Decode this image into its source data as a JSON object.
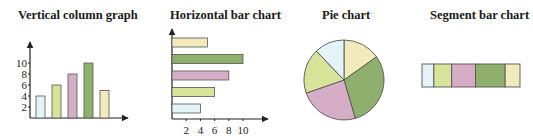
{
  "colors": {
    "blue": "#e4f3f8",
    "lime": "#d8e39a",
    "pink": "#d5adc4",
    "green": "#8fb06c",
    "cream": "#f1ebbc",
    "stroke": "#555555",
    "axis": "#222222"
  },
  "titles": {
    "vertical": "Vertical column graph",
    "horizontal": "Horizontal bar chart",
    "pie": "Pie chart",
    "segment": "Segment bar chart"
  },
  "chart_data": [
    {
      "type": "bar",
      "orientation": "vertical",
      "title": "Vertical column graph",
      "categories": [
        "1",
        "2",
        "3",
        "4",
        "5"
      ],
      "values": [
        4,
        6,
        8,
        10,
        5
      ],
      "colors": [
        "blue",
        "lime",
        "pink",
        "green",
        "cream"
      ],
      "yticks": [
        "2",
        "4",
        "6",
        "8",
        "10"
      ],
      "xlabel": "",
      "ylabel": "",
      "ylim": [
        0,
        12
      ],
      "grid": false
    },
    {
      "type": "bar",
      "orientation": "horizontal",
      "title": "Horizontal bar chart",
      "categories": [
        "1",
        "2",
        "3",
        "4",
        "5"
      ],
      "values": [
        5,
        10,
        8,
        6,
        4
      ],
      "colors": [
        "cream",
        "green",
        "pink",
        "lime",
        "blue"
      ],
      "xticks": [
        "2",
        "4",
        "6",
        "8",
        "10"
      ],
      "xlim": [
        0,
        12
      ],
      "grid": false
    },
    {
      "type": "pie",
      "title": "Pie chart",
      "values": [
        5,
        10,
        8,
        6,
        4
      ],
      "colors": [
        "cream",
        "green",
        "pink",
        "lime",
        "blue"
      ],
      "start_angle": "12 o'clock, clockwise"
    },
    {
      "type": "bar",
      "orientation": "stacked-horizontal",
      "title": "Segment bar chart",
      "values": [
        4,
        6,
        8,
        10,
        5
      ],
      "colors": [
        "blue",
        "lime",
        "pink",
        "green",
        "cream"
      ]
    }
  ]
}
